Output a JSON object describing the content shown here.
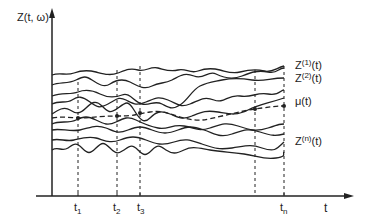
{
  "axes": {
    "y_label": "Z(t, ω)",
    "x_label": "t"
  },
  "time_ticks": [
    {
      "base": "t",
      "sub": "1"
    },
    {
      "base": "t",
      "sub": "2"
    },
    {
      "base": "t",
      "sub": "3"
    },
    {
      "base": "t",
      "sub": "n"
    }
  ],
  "series_labels": [
    {
      "base": "Z",
      "sup": "(1)",
      "suffix": "(t)"
    },
    {
      "base": "Z",
      "sup": "(2)",
      "suffix": "(t)"
    },
    {
      "base": "μ",
      "sup": "",
      "suffix": "(t)"
    },
    {
      "base": "Z",
      "sup": "(n)",
      "suffix": "(t)"
    }
  ],
  "colors": {
    "line": "#222222",
    "background": "#ffffff"
  }
}
